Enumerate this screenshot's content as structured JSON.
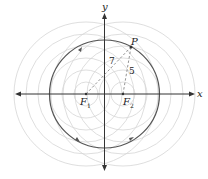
{
  "diagram": {
    "axes": {
      "x_label": "x",
      "y_label": "y"
    },
    "foci": [
      {
        "label": "F",
        "sub": "1"
      },
      {
        "label": "F",
        "sub": "2"
      }
    ],
    "point": {
      "label": "P"
    },
    "distances": {
      "PF1": "7",
      "PF2": "5"
    },
    "colors": {
      "ellipse": "#555555",
      "circles": "#d0d0d0",
      "axes": "#333333",
      "dashed": "#888888"
    }
  }
}
